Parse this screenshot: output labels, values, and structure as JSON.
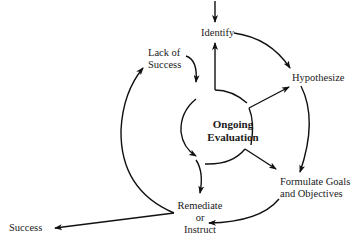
{
  "diagram": {
    "type": "cycle",
    "nodes": {
      "identify": "Identify",
      "hypothesize": "Hypothesize",
      "formulate_line1": "Formulate Goals",
      "formulate_line2": "and Objectives",
      "remediate_line1": "Remediate",
      "remediate_line2": "or",
      "remediate_line3": "Instruct",
      "lack_line1": "Lack of",
      "lack_line2": "Success",
      "success": "Success",
      "center_line1": "Ongoing",
      "center_line2": "Evaluation"
    },
    "edges": [
      {
        "from": "(entry)",
        "to": "Identify"
      },
      {
        "from": "Identify",
        "to": "Hypothesize"
      },
      {
        "from": "Hypothesize",
        "to": "Formulate Goals and Objectives"
      },
      {
        "from": "Formulate Goals and Objectives",
        "to": "Remediate or Instruct"
      },
      {
        "from": "Remediate or Instruct",
        "to": "Success"
      },
      {
        "from": "Remediate or Instruct",
        "to": "Lack of Success"
      },
      {
        "from": "Lack of Success",
        "to": "Ongoing Evaluation"
      },
      {
        "from": "Ongoing Evaluation",
        "to": "Identify"
      },
      {
        "from": "Ongoing Evaluation",
        "to": "Hypothesize"
      },
      {
        "from": "Ongoing Evaluation",
        "to": "Formulate Goals and Objectives"
      },
      {
        "from": "Ongoing Evaluation",
        "to": "Remediate or Instruct"
      }
    ],
    "colors": {
      "stroke": "#111111",
      "text": "#1a1a1a",
      "background": "#ffffff"
    }
  }
}
